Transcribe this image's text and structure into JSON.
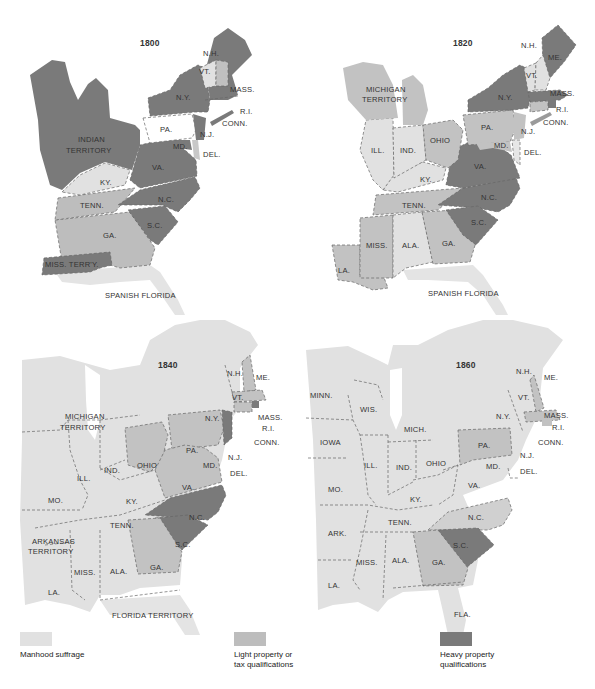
{
  "colors": {
    "manhood_suffrage": "#e1e1e1",
    "light_property": "#bdbdbd",
    "heavy_property": "#7a7a7a",
    "unshaded": "#ffffff",
    "background": "#ffffff"
  },
  "panels": [
    {
      "year": "1800",
      "labels": {
        "nh": "N.H.",
        "vt": "VT.",
        "mass": "MASS.",
        "ri": "R.I.",
        "conn": "CONN.",
        "ny": "N.Y.",
        "pa": "PA.",
        "nj": "N.J.",
        "md": "MD.",
        "del": "DEL.",
        "indian_1": "INDIAN",
        "indian_2": "TERRITORY",
        "va": "VA.",
        "ky": "KY.",
        "tenn": "TENN.",
        "nc": "N.C.",
        "sc": "S.C.",
        "ga": "GA.",
        "miss": "MISS. TERR'Y.",
        "florida": "SPANISH FLORIDA"
      },
      "classification": {
        "heavy_property": [
          "N.H.",
          "Mass.",
          "R.I.",
          "Conn.",
          "N.Y.",
          "N.J.",
          "Md.",
          "Indian Territory",
          "Va.",
          "N.C.",
          "S.C.",
          "Miss. Terr'y."
        ],
        "light_property": [
          "Tenn.",
          "Ga.",
          "Del."
        ],
        "manhood_suffrage": [
          "Vt.",
          "Ky."
        ],
        "unshaded": [
          "Pa."
        ]
      }
    },
    {
      "year": "1820",
      "labels": {
        "nh": "N.H.",
        "me": "ME.",
        "vt": "VT.",
        "mass": "MASS.",
        "ri": "R.I.",
        "conn": "CONN.",
        "ny": "N.Y.",
        "pa": "PA.",
        "nj": "N.J.",
        "md": "MD.",
        "del": "DEL.",
        "mich_1": "MICHIGAN",
        "mich_2": "TERRITORY",
        "ill": "ILL.",
        "ind": "IND.",
        "ohio": "OHIO",
        "ky": "KY.",
        "va": "VA.",
        "tenn": "TENN.",
        "nc": "N.C.",
        "sc": "S.C.",
        "miss": "MISS.",
        "ala": "ALA.",
        "ga": "GA.",
        "la": "LA.",
        "florida": "SPANISH FLORIDA"
      },
      "classification": {
        "heavy_property": [
          "Me.",
          "N.Y.",
          "Mass.",
          "R.I.",
          "Va.",
          "N.C.",
          "S.C."
        ],
        "light_property": [
          "Michigan Territory",
          "Ohio",
          "Pa.",
          "N.J.",
          "Md.",
          "Tenn.",
          "Miss.",
          "Ga.",
          "La.",
          "Conn."
        ],
        "manhood_suffrage": [
          "N.H.",
          "Vt.",
          "Ill.",
          "Ind.",
          "Ky.",
          "Ala.",
          "Del."
        ]
      }
    },
    {
      "year": "1840",
      "labels": {
        "nh": "N.H.",
        "me": "ME.",
        "vt": "VT.",
        "mass": "MASS.",
        "ri": "R.I.",
        "conn": "CONN.",
        "ny": "N.Y.",
        "pa": "PA.",
        "nj": "N.J.",
        "md": "MD.",
        "del": "DEL.",
        "mich_1": "MICHIGAN",
        "mich_2": "TERRITORY",
        "ill": "ILL.",
        "ind": "IND.",
        "ohio": "OHIO",
        "mo": "MO.",
        "ky": "KY.",
        "va": "VA.",
        "tenn": "TENN.",
        "nc": "N.C.",
        "sc": "S.C.",
        "ark_1": "ARKANSAS",
        "ark_2": "TERRITORY",
        "miss": "MISS.",
        "ala": "ALA.",
        "ga": "GA.",
        "la": "LA.",
        "florida": "FLORIDA TERRITORY"
      },
      "classification": {
        "heavy_property": [
          "N.J.",
          "R.I.",
          "N.C.",
          "S.C."
        ],
        "light_property": [
          "N.H.",
          "Mass.",
          "Conn.",
          "Pa.",
          "Ohio",
          "Va.",
          "Ga."
        ],
        "manhood_suffrage": [
          "Me.",
          "Vt.",
          "N.Y.",
          "Michigan Territory",
          "Ill.",
          "Ind.",
          "Mo.",
          "Ky.",
          "Tenn.",
          "Arkansas Territory",
          "Miss.",
          "Ala.",
          "La.",
          "Md.",
          "Del.",
          "Florida Territory"
        ]
      }
    },
    {
      "year": "1860",
      "labels": {
        "nh": "N.H.",
        "me": "ME.",
        "vt": "VT.",
        "mass": "MASS.",
        "ri": "R.I.",
        "conn": "CONN.",
        "ny": "N.Y.",
        "pa": "PA.",
        "nj": "N.J.",
        "md": "MD.",
        "del": "DEL.",
        "minn": "MINN.",
        "wis": "WIS.",
        "mich": "MICH.",
        "iowa": "IOWA",
        "ill": "ILL.",
        "ind": "IND.",
        "ohio": "OHIO",
        "mo": "MO.",
        "ky": "KY.",
        "va": "VA.",
        "ark": "ARK.",
        "tenn": "TENN.",
        "nc": "N.C.",
        "sc": "S.C.",
        "miss": "MISS.",
        "ala": "ALA.",
        "ga": "GA.",
        "la": "LA.",
        "fla": "FLA."
      },
      "classification": {
        "heavy_property": [
          "S.C."
        ],
        "light_property": [
          "N.H.",
          "Mass.",
          "R.I.",
          "Pa.",
          "N.C.",
          "Ga."
        ],
        "manhood_suffrage": [
          "Me.",
          "Vt.",
          "N.Y.",
          "Conn.",
          "N.J.",
          "Md.",
          "Del.",
          "Minn.",
          "Wis.",
          "Mich.",
          "Iowa",
          "Ill.",
          "Ind.",
          "Ohio",
          "Mo.",
          "Ky.",
          "Va.",
          "Ark.",
          "Tenn.",
          "Miss.",
          "Ala.",
          "La.",
          "Fla."
        ]
      }
    }
  ],
  "legend": [
    {
      "key": "manhood_suffrage",
      "label_1": "Manhood suffrage",
      "label_2": ""
    },
    {
      "key": "light_property",
      "label_1": "Light property or",
      "label_2": "tax qualifications"
    },
    {
      "key": "heavy_property",
      "label_1": "Heavy property",
      "label_2": "qualifications"
    }
  ]
}
